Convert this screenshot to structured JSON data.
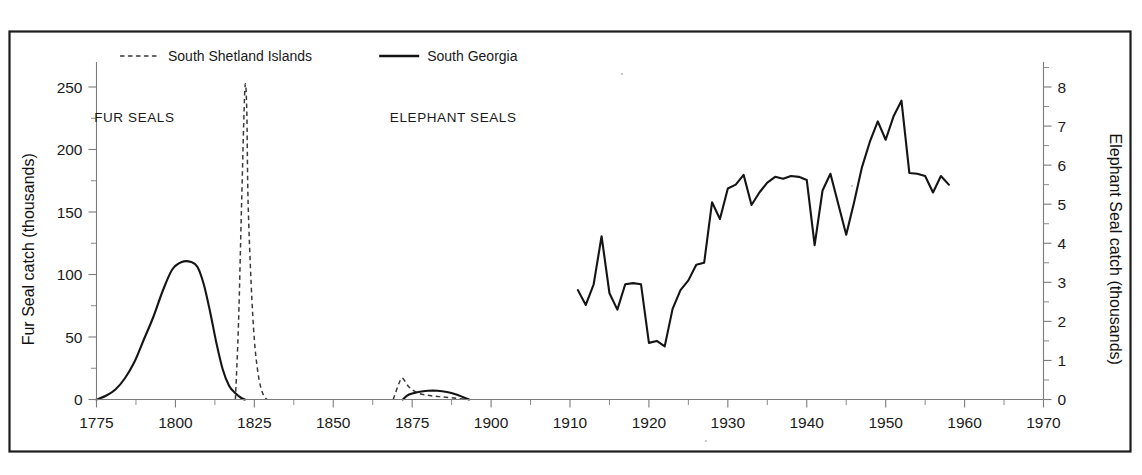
{
  "figure": {
    "kind": "scientific-line-chart",
    "background_color": "#ffffff",
    "frame_color": "#1c1c1c",
    "ink_color": "#141414"
  },
  "legend": {
    "position": "top-left-inside",
    "entries": [
      {
        "label": "South Shetland Islands",
        "style": "dashed",
        "color": "#3a3a3a"
      },
      {
        "label": "South Georgia",
        "style": "solid",
        "color": "#141414"
      }
    ]
  },
  "annotations": [
    {
      "text": "FUR SEALS",
      "x_year": 1787,
      "y_left_value": 222
    },
    {
      "text": "ELEPHANT SEALS",
      "x_year": 1888,
      "y_left_value": 222
    }
  ],
  "axes": {
    "x": {
      "label": "",
      "ticks": [
        1775,
        1800,
        1825,
        1850,
        1875,
        1900,
        1910,
        1920,
        1930,
        1940,
        1950,
        1960,
        1970
      ],
      "tick_labels": [
        "1775",
        "1800",
        "1825",
        "1850",
        "1875",
        "1900",
        "1910",
        "1920",
        "1930",
        "1940",
        "1950",
        "1960",
        "1970"
      ],
      "minor_ticks_note": "midpoint between each pair of labelled ticks",
      "scale_note": "piecewise: 25-year spacing from 1775 to 1900, then 10-year spacing from 1900 to 1970, equal pixel width per interval"
    },
    "y_left": {
      "label": "Fur Seal catch (thousands)",
      "ticks": [
        0,
        50,
        100,
        150,
        200,
        250
      ],
      "tick_labels": [
        "0",
        "50",
        "100",
        "150",
        "200",
        "250"
      ],
      "minor_ticks": [
        25,
        75,
        125,
        175,
        225,
        275
      ],
      "range": [
        0,
        275
      ]
    },
    "y_right": {
      "label": "Elephant Seal catch (thousands)",
      "ticks": [
        0,
        1,
        2,
        3,
        4,
        5,
        6,
        7,
        8
      ],
      "tick_labels": [
        "0",
        "1",
        "2",
        "3",
        "4",
        "5",
        "6",
        "7",
        "8"
      ],
      "minor_ticks": [
        0.5,
        1.5,
        2.5,
        3.5,
        4.5,
        5.5,
        6.5,
        7.5,
        8.5
      ],
      "range": [
        0,
        8.8
      ]
    }
  },
  "chart_data": {
    "type": "line",
    "title": "",
    "xlabel": "",
    "ylabel": "Fur Seal catch (thousands)",
    "ylabel_right": "Elephant Seal catch (thousands)",
    "ylim": [
      0,
      275
    ],
    "ylim_right": [
      0,
      8.8
    ],
    "xlim": [
      1775,
      1970
    ],
    "grid": false,
    "legend_position": "top-left",
    "series": [
      {
        "name": "South Georgia - fur seal catch (early)",
        "axis": "left",
        "style": "solid",
        "color": "#141414",
        "points": [
          [
            1775,
            0
          ],
          [
            1778,
            3
          ],
          [
            1781,
            8
          ],
          [
            1784,
            17
          ],
          [
            1787,
            30
          ],
          [
            1790,
            48
          ],
          [
            1793,
            66
          ],
          [
            1796,
            87
          ],
          [
            1799,
            104
          ],
          [
            1802,
            110
          ],
          [
            1805,
            110
          ],
          [
            1807,
            106
          ],
          [
            1809,
            92
          ],
          [
            1811,
            70
          ],
          [
            1813,
            45
          ],
          [
            1815,
            24
          ],
          [
            1817,
            11
          ],
          [
            1819,
            5
          ],
          [
            1821,
            1
          ],
          [
            1822,
            0
          ]
        ]
      },
      {
        "name": "South Shetland Islands - fur seal catch (1820s spike)",
        "axis": "left",
        "style": "dashed",
        "color": "#3a3a3a",
        "points": [
          [
            1819,
            0
          ],
          [
            1820,
            62
          ],
          [
            1821,
            160
          ],
          [
            1822,
            248
          ],
          [
            1822.6,
            232
          ],
          [
            1823,
            160
          ],
          [
            1824,
            92
          ],
          [
            1825,
            48
          ],
          [
            1826,
            24
          ],
          [
            1827,
            10
          ],
          [
            1828,
            3
          ],
          [
            1829,
            0
          ]
        ]
      },
      {
        "name": "South Shetland Islands - fur seal catch (1870s)",
        "axis": "left",
        "style": "dashed",
        "color": "#3a3a3a",
        "points": [
          [
            1869,
            0
          ],
          [
            1871,
            14
          ],
          [
            1872,
            17
          ],
          [
            1874,
            10
          ],
          [
            1877,
            5
          ],
          [
            1881,
            3
          ],
          [
            1885,
            2
          ],
          [
            1889,
            1
          ],
          [
            1892,
            0
          ]
        ]
      },
      {
        "name": "South Georgia - fur seal catch (1870s-1890s)",
        "axis": "left",
        "style": "solid",
        "color": "#141414",
        "points": [
          [
            1872,
            0
          ],
          [
            1874,
            4
          ],
          [
            1877,
            6
          ],
          [
            1880,
            7
          ],
          [
            1883,
            7
          ],
          [
            1886,
            6
          ],
          [
            1889,
            4
          ],
          [
            1891,
            2
          ],
          [
            1893,
            0
          ]
        ]
      },
      {
        "name": "South Georgia - elephant seal catch",
        "axis": "right",
        "style": "solid",
        "color": "#141414",
        "points": [
          [
            1911,
            2.8
          ],
          [
            1912,
            2.42
          ],
          [
            1913,
            2.95
          ],
          [
            1914,
            4.18
          ],
          [
            1915,
            2.72
          ],
          [
            1916,
            2.3
          ],
          [
            1917,
            2.95
          ],
          [
            1918,
            2.98
          ],
          [
            1919,
            2.95
          ],
          [
            1920,
            1.45
          ],
          [
            1921,
            1.5
          ],
          [
            1922,
            1.36
          ],
          [
            1923,
            2.32
          ],
          [
            1924,
            2.8
          ],
          [
            1925,
            3.05
          ],
          [
            1926,
            3.45
          ],
          [
            1927,
            3.5
          ],
          [
            1928,
            5.05
          ],
          [
            1929,
            4.62
          ],
          [
            1930,
            5.4
          ],
          [
            1931,
            5.5
          ],
          [
            1932,
            5.75
          ],
          [
            1933,
            4.98
          ],
          [
            1934,
            5.3
          ],
          [
            1935,
            5.55
          ],
          [
            1936,
            5.7
          ],
          [
            1937,
            5.65
          ],
          [
            1938,
            5.72
          ],
          [
            1939,
            5.7
          ],
          [
            1940,
            5.62
          ],
          [
            1941,
            3.95
          ],
          [
            1942,
            5.35
          ],
          [
            1943,
            5.78
          ],
          [
            1944,
            5.0
          ],
          [
            1945,
            4.22
          ],
          [
            1946,
            5.05
          ],
          [
            1947,
            5.95
          ],
          [
            1948,
            6.6
          ],
          [
            1949,
            7.12
          ],
          [
            1950,
            6.65
          ],
          [
            1951,
            7.25
          ],
          [
            1952,
            7.65
          ],
          [
            1953,
            5.8
          ],
          [
            1954,
            5.78
          ],
          [
            1955,
            5.72
          ],
          [
            1956,
            5.3
          ],
          [
            1957,
            5.72
          ],
          [
            1958,
            5.5
          ]
        ]
      }
    ]
  }
}
